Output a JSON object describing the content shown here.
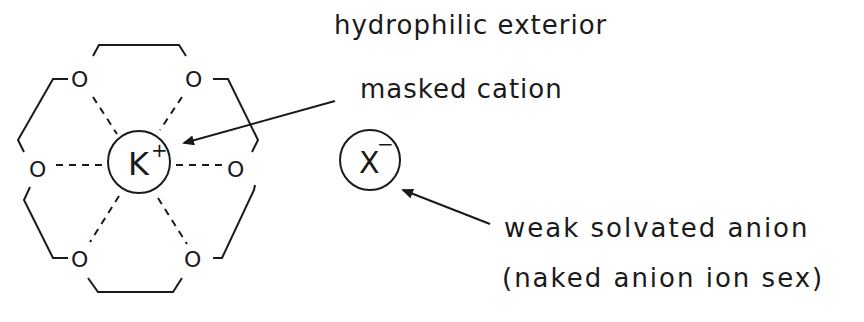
{
  "diagram": {
    "labels": {
      "hydrophilic_exterior": "hydrophilic exterior",
      "masked_cation": "masked cation",
      "weak_solvated_anion": "weak solvated anion",
      "naked_anion": "(naked anion ion sex)"
    },
    "crown_ether": {
      "oxygen_atoms": [
        "O",
        "O",
        "O",
        "O",
        "O",
        "O"
      ],
      "central_cation": "K",
      "cation_charge": "+"
    },
    "anion": {
      "symbol": "X",
      "charge": "−"
    },
    "colors": {
      "ink": "#1a1a1a",
      "background": "#ffffff"
    }
  }
}
